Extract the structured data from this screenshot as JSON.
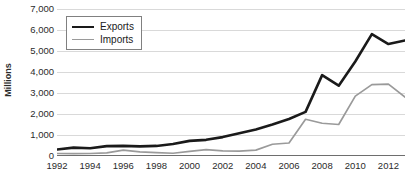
{
  "chart_data": {
    "type": "line",
    "title": "",
    "xlabel": "",
    "ylabel": "Millions",
    "ylim": [
      0,
      7000
    ],
    "xlim": [
      1992,
      2013
    ],
    "grid": true,
    "legend_position": "top-left",
    "y_ticks": [
      "0",
      "1,000",
      "2,000",
      "3,000",
      "4,000",
      "5,000",
      "6,000",
      "7,000"
    ],
    "y_tick_values": [
      0,
      1000,
      2000,
      3000,
      4000,
      5000,
      6000,
      7000
    ],
    "x_tick_labels": [
      "1992",
      "1994",
      "1996",
      "1998",
      "2000",
      "2002",
      "2004",
      "2006",
      "2008",
      "2010",
      "2012"
    ],
    "x_tick_values": [
      1992,
      1994,
      1996,
      1998,
      2000,
      2002,
      2004,
      2006,
      2008,
      2010,
      2012
    ],
    "x": [
      1992,
      1993,
      1994,
      1995,
      1996,
      1997,
      1998,
      1999,
      2000,
      2001,
      2002,
      2003,
      2004,
      2005,
      2006,
      2007,
      2008,
      2009,
      2010,
      2011,
      2012,
      2013
    ],
    "series": [
      {
        "name": "Exports",
        "color": "#1a1a1a",
        "width": 2.6,
        "values": [
          310,
          400,
          370,
          470,
          480,
          460,
          480,
          570,
          720,
          770,
          900,
          1080,
          1260,
          1500,
          1760,
          2100,
          3850,
          3350,
          4500,
          5800,
          5330,
          5500
        ]
      },
      {
        "name": "Imports",
        "color": "#9a9a9a",
        "width": 1.7,
        "values": [
          120,
          110,
          120,
          150,
          280,
          200,
          160,
          130,
          220,
          300,
          240,
          230,
          280,
          560,
          620,
          1750,
          1560,
          1500,
          2850,
          3400,
          3420,
          2800
        ]
      }
    ]
  },
  "legend": {
    "items": [
      {
        "label": "Exports"
      },
      {
        "label": "Imports"
      }
    ]
  }
}
